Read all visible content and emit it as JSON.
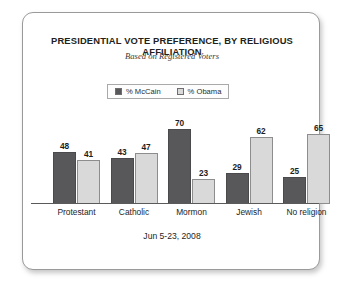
{
  "chart_data": {
    "type": "bar",
    "title": "PRESIDENTIAL VOTE PREFERENCE, BY RELIGIOUS AFFILIATION",
    "subtitle": "Based on Registered Voters",
    "footnote": "Jun 5-23, 2008",
    "categories": [
      "Protestant",
      "Catholic",
      "Mormon",
      "Jewish",
      "No religion"
    ],
    "series": [
      {
        "name": "% McCain",
        "color": "#58585a",
        "values": [
          48,
          43,
          70,
          29,
          25
        ]
      },
      {
        "name": "% Obama",
        "color": "#d9d9d9",
        "values": [
          41,
          47,
          23,
          62,
          65
        ]
      }
    ],
    "xlabel": "",
    "ylabel": "",
    "ylim": [
      0,
      80
    ],
    "grid": false,
    "legend_position": "top-center",
    "axis_visible": true
  }
}
